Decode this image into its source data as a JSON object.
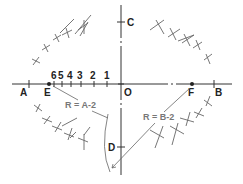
{
  "figure": {
    "type": "ellipse construction (trammel / four-center method)",
    "axis_labels": {
      "A": "A",
      "B": "B",
      "C": "C",
      "D": "D",
      "E": "E",
      "F": "F",
      "O": "O"
    },
    "division_labels": [
      "6",
      "5",
      "4",
      "3",
      "2",
      "1"
    ],
    "radius_labels": {
      "left": "R = A-2",
      "right": "R = B-2"
    },
    "colors": {
      "line": "#333333",
      "construction": "#666666",
      "background": "#ffffff"
    }
  }
}
